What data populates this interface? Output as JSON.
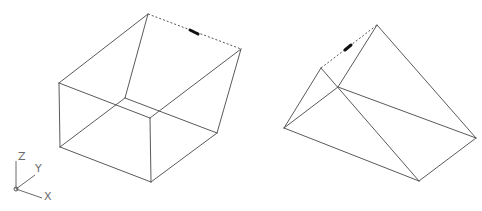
{
  "viewport": {
    "background": "#ffffff",
    "line_color": "#5a5a5a"
  },
  "ucs_icon": {
    "z_label": "Z",
    "y_label": "Y",
    "x_label": "X"
  },
  "left_solid": {
    "name": "wedge-box",
    "vertices": {
      "top": [
        148,
        14
      ],
      "right_top": [
        241,
        49
      ],
      "left_top": [
        59,
        83
      ],
      "inner": [
        125,
        98
      ],
      "front_top": [
        150,
        118
      ],
      "right_bottom": [
        217,
        133
      ],
      "left_bottom": [
        60,
        147
      ],
      "front_bottom": [
        151,
        182
      ]
    },
    "dashed_edge": [
      "top",
      "right_top"
    ],
    "grip_marker": [
      [
        189,
        29
      ],
      [
        199,
        35
      ]
    ]
  },
  "right_solid": {
    "name": "triangular-prism",
    "vertices": {
      "apex": [
        377,
        25
      ],
      "small_top": [
        321,
        68
      ],
      "inner": [
        338,
        87
      ],
      "left": [
        284,
        128
      ],
      "bottom": [
        419,
        181
      ],
      "right": [
        476,
        138
      ]
    },
    "dashed_edge": [
      "small_top",
      "apex"
    ],
    "grip_marker": [
      [
        345,
        50
      ],
      [
        351,
        45
      ]
    ]
  }
}
